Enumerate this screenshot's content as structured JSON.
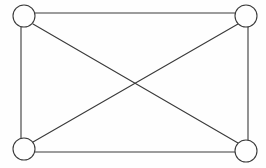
{
  "diagram": {
    "type": "undirected-graph",
    "background_color": "#fefefe",
    "stroke_color": "#3a3a3a",
    "node_fill_color": "#fefefe",
    "stroke_width": 1.1,
    "node_radius": 11,
    "node_count": 4,
    "edge_count": 6,
    "canvas": {
      "width": 266,
      "height": 168
    },
    "nodes": [
      {
        "id": "top-left",
        "label": "",
        "cx": 24,
        "cy": 16,
        "r": 11
      },
      {
        "id": "top-right",
        "label": "",
        "cx": 246,
        "cy": 16,
        "r": 11
      },
      {
        "id": "bottom-left",
        "label": "",
        "cx": 24,
        "cy": 149,
        "r": 11
      },
      {
        "id": "bottom-right",
        "label": "",
        "cx": 246,
        "cy": 151,
        "r": 11
      }
    ],
    "edges": [
      {
        "id": "edge-top",
        "from": "top-left",
        "to": "top-right",
        "x1": 35,
        "y1": 13,
        "x2": 246,
        "y2": 13
      },
      {
        "id": "edge-left",
        "from": "top-left",
        "to": "bottom-left",
        "x1": 21,
        "y1": 27,
        "x2": 21,
        "y2": 138
      },
      {
        "id": "edge-right",
        "from": "top-right",
        "to": "bottom-right",
        "x1": 248,
        "y1": 27,
        "x2": 248,
        "y2": 140
      },
      {
        "id": "edge-bottom",
        "from": "bottom-left",
        "to": "bottom-right",
        "x1": 35,
        "y1": 152,
        "x2": 235,
        "y2": 152
      },
      {
        "id": "edge-diagonal-main",
        "from": "top-left",
        "to": "bottom-right",
        "x1": 33,
        "y1": 24,
        "x2": 238,
        "y2": 143
      },
      {
        "id": "edge-diagonal-anti",
        "from": "bottom-left",
        "to": "top-right",
        "x1": 33,
        "y1": 142,
        "x2": 238,
        "y2": 24
      }
    ],
    "crossing_point": {
      "x": 133,
      "y": 83
    }
  }
}
